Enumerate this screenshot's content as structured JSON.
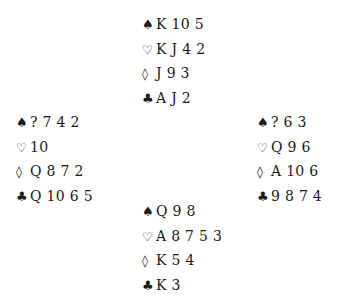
{
  "suits": {
    "spades": "♠",
    "hearts": "♡",
    "diamonds": "◊",
    "clubs": "♣"
  },
  "hands": {
    "north": {
      "spades": "K 10 5",
      "hearts": "K J 4 2",
      "diamonds": "J 9 3",
      "clubs": "A J 2"
    },
    "west": {
      "spades": "? 7 4 2",
      "hearts": "10",
      "diamonds": "Q 8 7 2",
      "clubs": "Q 10 6 5"
    },
    "east": {
      "spades": "? 6 3",
      "hearts": "Q 9 6",
      "diamonds": "A 10 6",
      "clubs": "9 8 7 4"
    },
    "south": {
      "spades": "Q 9 8",
      "hearts": "A 8 7 5 3",
      "diamonds": "K 5 4",
      "clubs": "K 3"
    }
  }
}
